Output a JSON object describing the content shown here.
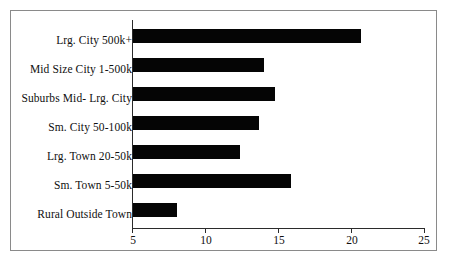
{
  "chart": {
    "title": "",
    "background_color": "#ffffff",
    "bar_color": "#050505",
    "axis_color": "#2b2b2b",
    "frame_color": "#8a8a8a"
  },
  "chart_data": {
    "type": "bar",
    "orientation": "horizontal",
    "title": "",
    "subtitle": "",
    "xlabel": "",
    "ylabel": "",
    "xlim": [
      5,
      25
    ],
    "grid": false,
    "legend": null,
    "xticks": [
      5,
      10,
      15,
      20,
      25
    ],
    "xtick_labels": [
      "5",
      "10",
      "15",
      "20",
      "25"
    ],
    "categories": [
      "Lrg. City 500k+",
      "Mid Size City 1-500k",
      "Suburbs Mid- Lrg. City",
      "Sm. City 50-100k",
      "Lrg. Town 20-50k",
      "Sm. Town 5-50k",
      "Rural Outside Town"
    ],
    "values": [
      20.6,
      14.0,
      14.7,
      13.6,
      12.3,
      15.8,
      8.0
    ]
  }
}
